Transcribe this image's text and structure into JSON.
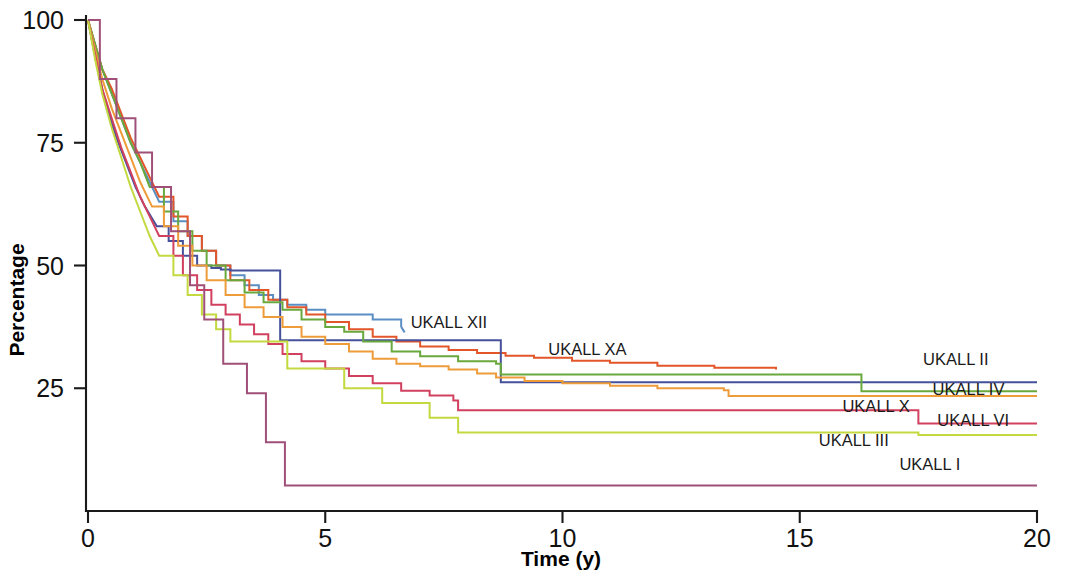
{
  "chart_data": {
    "type": "line",
    "title": "",
    "subtitle": "",
    "xlabel": "Time (y)",
    "ylabel": "Percentage",
    "xlim": [
      0,
      20
    ],
    "ylim": [
      0,
      100
    ],
    "xticks": [
      0,
      5,
      10,
      15,
      20
    ],
    "xtick_labels": [
      "0",
      "5",
      "10",
      "15",
      "20"
    ],
    "yticks": [
      25,
      50,
      75,
      100
    ],
    "ytick_labels": [
      "25",
      "50",
      "75",
      "100"
    ],
    "grid": false,
    "legend_position": "inline-right-labels",
    "step": "post",
    "annotations": [
      "UKALL XII",
      "UKALL XA",
      "UKALL II",
      "UKALL IV",
      "UKALL X",
      "UKALL VI",
      "UKALL III",
      "UKALL I"
    ],
    "series": [
      {
        "name": "UKALL XII",
        "color": "#5b8fc4",
        "label": "UKALL XII",
        "label_x": 6.8,
        "label_y": 37.2,
        "x": [
          0,
          0.15,
          0.3,
          0.5,
          0.7,
          0.9,
          1.1,
          1.3,
          1.5,
          1.8,
          2.1,
          2.4,
          2.7,
          3.0,
          3.3,
          3.6,
          3.9,
          4.2,
          4.6,
          5.0,
          5.4,
          6.0,
          6.6
        ],
        "y": [
          100,
          95,
          90,
          85,
          80,
          75,
          71,
          67,
          63,
          59,
          56,
          53,
          50,
          48,
          46,
          44,
          43,
          42,
          41,
          40,
          40,
          39,
          37.5
        ]
      },
      {
        "name": "UKALL XA",
        "color": "#e2562a",
        "label": "UKALL XA",
        "label_x": 9.7,
        "label_y": 31.8,
        "x": [
          0,
          0.15,
          0.3,
          0.5,
          0.7,
          0.9,
          1.1,
          1.3,
          1.5,
          1.8,
          2.1,
          2.4,
          2.7,
          3.0,
          3.4,
          3.8,
          4.2,
          4.6,
          5.0,
          5.5,
          6.0,
          6.5,
          7.0,
          7.6,
          8.2,
          8.8,
          9.4,
          10.2,
          11.0,
          12.0,
          13.2,
          14.5
        ],
        "y": [
          100,
          95,
          90,
          86,
          81,
          76,
          72,
          68,
          64,
          60,
          56,
          53,
          50,
          47,
          45,
          43,
          41.5,
          40,
          38.5,
          37,
          35.5,
          34.5,
          33.5,
          32.8,
          32.2,
          31.6,
          31.2,
          30.6,
          30.2,
          29.6,
          29.2,
          28.8
        ]
      },
      {
        "name": "UKALL II",
        "color": "#46519b",
        "label": "UKALL II",
        "label_x": 17.6,
        "label_y": 29.8,
        "x": [
          0,
          0.12,
          0.25,
          0.4,
          0.6,
          0.8,
          1.0,
          1.2,
          1.45,
          1.7,
          2.0,
          2.3,
          2.6,
          2.8,
          3.0,
          3.5,
          4.0,
          4.05,
          5.0,
          6.0,
          7.0,
          8.0,
          8.6,
          8.7,
          10.0,
          12.0,
          14.0,
          16.0,
          18.0,
          20.0
        ],
        "y": [
          100,
          94,
          88,
          82,
          76,
          71,
          66,
          62,
          58,
          55,
          52,
          50,
          49.5,
          49.2,
          49,
          49,
          49,
          34.8,
          34.8,
          34.8,
          34.8,
          34.8,
          34.8,
          26.2,
          26.2,
          26.2,
          26.2,
          26.2,
          26.2,
          26.2
        ]
      },
      {
        "name": "UKALL IV",
        "color": "#69a83c",
        "label": "UKALL IV",
        "label_x": 17.8,
        "label_y": 23.6,
        "x": [
          0,
          0.15,
          0.3,
          0.5,
          0.7,
          0.9,
          1.1,
          1.3,
          1.6,
          1.9,
          2.2,
          2.5,
          2.9,
          3.3,
          3.7,
          4.1,
          4.5,
          5.0,
          5.4,
          5.8,
          6.4,
          7.0,
          7.8,
          8.6,
          8.7,
          10.5,
          12.5,
          14.5,
          16.2,
          16.3,
          18.0,
          20.0
        ],
        "y": [
          100,
          95,
          90,
          85,
          80,
          75,
          71,
          66,
          61,
          57,
          53,
          50,
          47,
          44.5,
          42.5,
          41,
          39,
          37.5,
          36.5,
          34.5,
          32.5,
          31.5,
          30.5,
          30.0,
          27.8,
          27.8,
          27.8,
          27.8,
          27.8,
          24.4,
          24.4,
          24.4
        ]
      },
      {
        "name": "UKALL X",
        "color": "#ee9b3a",
        "label": "UKALL X",
        "label_x": 15.9,
        "label_y": 20.2,
        "x": [
          0,
          0.15,
          0.3,
          0.5,
          0.7,
          0.9,
          1.1,
          1.35,
          1.6,
          1.9,
          2.2,
          2.5,
          2.9,
          3.3,
          3.7,
          4.1,
          4.5,
          5.0,
          5.5,
          6.0,
          6.5,
          7.0,
          7.6,
          8.2,
          8.6,
          9.2,
          10.0,
          11.0,
          12.0,
          13.4,
          13.5,
          15.0,
          17.0,
          20.0
        ],
        "y": [
          100,
          94,
          88,
          82,
          77,
          72,
          67,
          62,
          58,
          54,
          50,
          47,
          44,
          41.5,
          39.5,
          37.5,
          35.5,
          34,
          32.5,
          31,
          30,
          29.5,
          28.8,
          28,
          27.2,
          26.5,
          26,
          25.5,
          25,
          24.6,
          23.4,
          23.4,
          23.4,
          23.4
        ]
      },
      {
        "name": "UKALL VI",
        "color": "#d1405f",
        "label": "UKALL VI",
        "label_x": 17.9,
        "label_y": 17.4,
        "x": [
          0,
          0.15,
          0.3,
          0.5,
          0.7,
          0.9,
          1.1,
          1.3,
          1.5,
          1.8,
          2.0,
          2.3,
          2.6,
          2.9,
          3.2,
          3.5,
          3.8,
          4.1,
          4.5,
          5.0,
          5.5,
          6.0,
          6.6,
          7.2,
          7.7,
          7.8,
          9.0,
          11.0,
          13.0,
          15.0,
          17.4,
          17.5,
          20.0
        ],
        "y": [
          100,
          93,
          86,
          80,
          74,
          69,
          64,
          60,
          56,
          52,
          48,
          45,
          42,
          40,
          38,
          36,
          34,
          32,
          30.5,
          29,
          27.5,
          26,
          24.5,
          23.5,
          22.5,
          20.5,
          20.5,
          20.5,
          20.5,
          20.5,
          20.5,
          17.8,
          17.8
        ]
      },
      {
        "name": "UKALL III",
        "color": "#c3d93f",
        "label": "UKALL III",
        "label_x": 15.4,
        "label_y": 13.2,
        "x": [
          0,
          0.15,
          0.3,
          0.5,
          0.7,
          0.9,
          1.1,
          1.3,
          1.5,
          1.8,
          2.1,
          2.4,
          2.7,
          3.0,
          3.0,
          3.6,
          4.2,
          4.2,
          4.8,
          5.4,
          5.4,
          6.2,
          6.2,
          7.2,
          7.2,
          7.8,
          7.8,
          9.5,
          12.0,
          15.0,
          17.5,
          20.0
        ],
        "y": [
          100,
          92,
          85,
          78,
          72,
          66,
          61,
          56,
          52,
          48,
          44,
          40,
          37,
          34.5,
          34.5,
          34.5,
          34.5,
          29,
          29,
          29,
          25,
          25,
          22,
          22,
          19,
          19,
          16,
          16,
          16,
          16,
          15.5,
          15.5
        ]
      },
      {
        "name": "UKALL I",
        "color": "#a05078",
        "label": "UKALL I",
        "label_x": 17.1,
        "label_y": 8.4,
        "x": [
          0,
          0.2,
          0.25,
          0.55,
          0.6,
          0.95,
          1.0,
          1.3,
          1.35,
          1.7,
          1.75,
          2.1,
          2.15,
          2.4,
          2.45,
          2.8,
          2.85,
          3.3,
          3.35,
          3.7,
          3.75,
          4.1,
          4.15,
          6.0,
          9.0,
          12.0,
          15.0,
          18.0,
          20.0
        ],
        "y": [
          100,
          100,
          88,
          88,
          80,
          80,
          73,
          73,
          66,
          66,
          57,
          57,
          46,
          46,
          39,
          39,
          30,
          30,
          24,
          24,
          14,
          14,
          5.2,
          5.2,
          5.2,
          5.2,
          5.2,
          5.2,
          5.2
        ]
      }
    ]
  },
  "axes": {
    "y_title": "Percentage",
    "x_title": "Time (y)"
  }
}
